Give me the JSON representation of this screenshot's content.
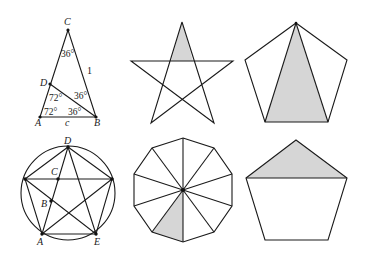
{
  "figure": {
    "shade_color": "#d6d6d6",
    "line_color": "#1a1a1a"
  },
  "panels": [
    {
      "id": "golden-triangle",
      "points": {
        "C": "C",
        "D": "D",
        "A": "A",
        "B": "B"
      },
      "side_labels": {
        "CB": "1",
        "AB": "c"
      },
      "angles": {
        "at_C": "36°",
        "at_D": "72°",
        "at_B_upper": "36°",
        "at_A": "72°",
        "at_B_lower": "36°"
      }
    },
    {
      "id": "pentagram-shaded-tip",
      "shaded": "top point triangle"
    },
    {
      "id": "pentagon-shaded-triangle",
      "shaded": "triangle from top vertex to bottom edge"
    },
    {
      "id": "inscribed-pentagram",
      "points": {
        "D": "D",
        "C": "C",
        "B": "B",
        "A": "A",
        "E": "E"
      }
    },
    {
      "id": "decagon-sectors",
      "sectors": 10,
      "shaded": "one sector (bottom-left)"
    },
    {
      "id": "pentagon-shaded-cap",
      "shaded": "top triangle above horizontal diagonal"
    }
  ]
}
